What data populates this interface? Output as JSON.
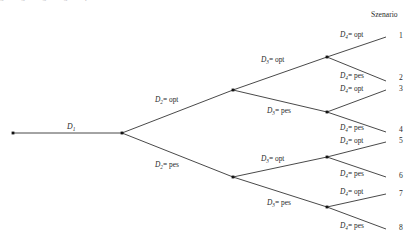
{
  "diagram": {
    "type": "decision-tree",
    "title_cut_off": "g g g g p",
    "scenario_header": "Szenario",
    "root": {
      "label_var": "D",
      "label_sub": "1",
      "node_x": 13,
      "node_y": 133,
      "stem_end_x": 122,
      "label_x": 67,
      "label_y": 123
    },
    "split_node": {
      "x": 122,
      "y": 133
    },
    "levels": [
      {
        "name": "D2",
        "var": "D",
        "sub": "2",
        "branches": [
          {
            "outcome": "opt",
            "label": "D2= opt",
            "label_x": 155,
            "label_y": 96,
            "node_x": 233,
            "node_y": 90
          },
          {
            "outcome": "pes",
            "label": "D2= pes",
            "label_x": 155,
            "label_y": 161,
            "node_x": 233,
            "node_y": 177
          }
        ]
      },
      {
        "name": "D3",
        "var": "D",
        "sub": "3",
        "branches": [
          {
            "outcome": "opt",
            "label": "D3= opt",
            "label_x": 261,
            "label_y": 56,
            "parent_x": 233,
            "parent_y": 90,
            "node_x": 327,
            "node_y": 57
          },
          {
            "outcome": "pes",
            "label": "D3= pes",
            "label_x": 267,
            "label_y": 107,
            "parent_x": 233,
            "parent_y": 90,
            "node_x": 327,
            "node_y": 112
          },
          {
            "outcome": "opt",
            "label": "D3= opt",
            "label_x": 261,
            "label_y": 155,
            "parent_x": 233,
            "parent_y": 177,
            "node_x": 327,
            "node_y": 157
          },
          {
            "outcome": "pes",
            "label": "D3= pes",
            "label_x": 267,
            "label_y": 199,
            "parent_x": 233,
            "parent_y": 177,
            "node_x": 327,
            "node_y": 207
          }
        ]
      },
      {
        "name": "D4",
        "var": "D",
        "sub": "4",
        "branches": [
          {
            "outcome": "opt",
            "label": "D4= opt",
            "label_x": 340,
            "label_y": 31,
            "parent_x": 327,
            "parent_y": 57,
            "end_x": 386,
            "end_y": 37,
            "scenario": "1"
          },
          {
            "outcome": "pes",
            "label": "D4= pes",
            "label_x": 340,
            "label_y": 72,
            "parent_x": 327,
            "parent_y": 57,
            "end_x": 386,
            "end_y": 81,
            "scenario": "2"
          },
          {
            "outcome": "opt",
            "label": "D4= opt",
            "label_x": 340,
            "label_y": 85,
            "parent_x": 327,
            "parent_y": 112,
            "end_x": 386,
            "end_y": 90,
            "scenario": "3"
          },
          {
            "outcome": "pes",
            "label": "D4= pes",
            "label_x": 340,
            "label_y": 124,
            "parent_x": 327,
            "parent_y": 112,
            "end_x": 386,
            "end_y": 132,
            "scenario": "4"
          },
          {
            "outcome": "opt",
            "label": "D4= opt",
            "label_x": 340,
            "label_y": 137,
            "parent_x": 327,
            "parent_y": 157,
            "end_x": 386,
            "end_y": 142,
            "scenario": "5"
          },
          {
            "outcome": "pes",
            "label": "D4= pes",
            "label_x": 340,
            "label_y": 170,
            "parent_x": 327,
            "parent_y": 157,
            "end_x": 386,
            "end_y": 177,
            "scenario": "6"
          },
          {
            "outcome": "opt",
            "label": "D4= opt",
            "label_x": 340,
            "label_y": 188,
            "parent_x": 327,
            "parent_y": 207,
            "end_x": 386,
            "end_y": 194,
            "scenario": "7"
          },
          {
            "outcome": "pes",
            "label": "D4= pes",
            "label_x": 340,
            "label_y": 222,
            "parent_x": 327,
            "parent_y": 207,
            "end_x": 386,
            "end_y": 229,
            "scenario": "8"
          }
        ]
      }
    ],
    "scenarios": [
      {
        "num": "1",
        "x": 396,
        "y": 32
      },
      {
        "num": "2",
        "x": 396,
        "y": 74
      },
      {
        "num": "3",
        "x": 396,
        "y": 85
      },
      {
        "num": "4",
        "x": 396,
        "y": 126
      },
      {
        "num": "5",
        "x": 396,
        "y": 137
      },
      {
        "num": "6",
        "x": 396,
        "y": 172
      },
      {
        "num": "7",
        "x": 396,
        "y": 190
      },
      {
        "num": "8",
        "x": 396,
        "y": 224
      }
    ],
    "scenario_header_pos": {
      "x": 371,
      "y": 11
    },
    "colors": {
      "line": "#1a1a1a",
      "node": "#111111",
      "text": "#2a2a2a",
      "background": "#ffffff"
    }
  }
}
